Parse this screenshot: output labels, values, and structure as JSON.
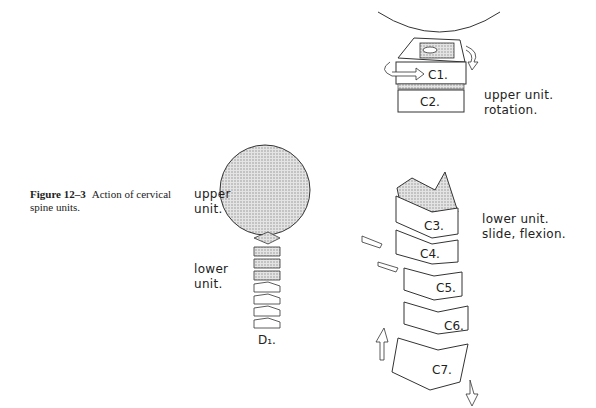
{
  "figure": {
    "number": "Figure 12–3",
    "caption": "Action of cervical spine units."
  },
  "left_diagram": {
    "upper_label": [
      "upper",
      "unit."
    ],
    "lower_label": [
      "lower",
      "unit."
    ],
    "base_mark": "D₁."
  },
  "right_diagram": {
    "upper_unit": {
      "vertebrae": [
        "C1.",
        "C2."
      ],
      "label": [
        "upper unit.",
        "rotation."
      ]
    },
    "lower_unit": {
      "vertebrae": [
        "C3.",
        "C4.",
        "C5.",
        "C6.",
        "C7."
      ],
      "label": [
        "lower unit.",
        "slide, flexion."
      ]
    }
  }
}
